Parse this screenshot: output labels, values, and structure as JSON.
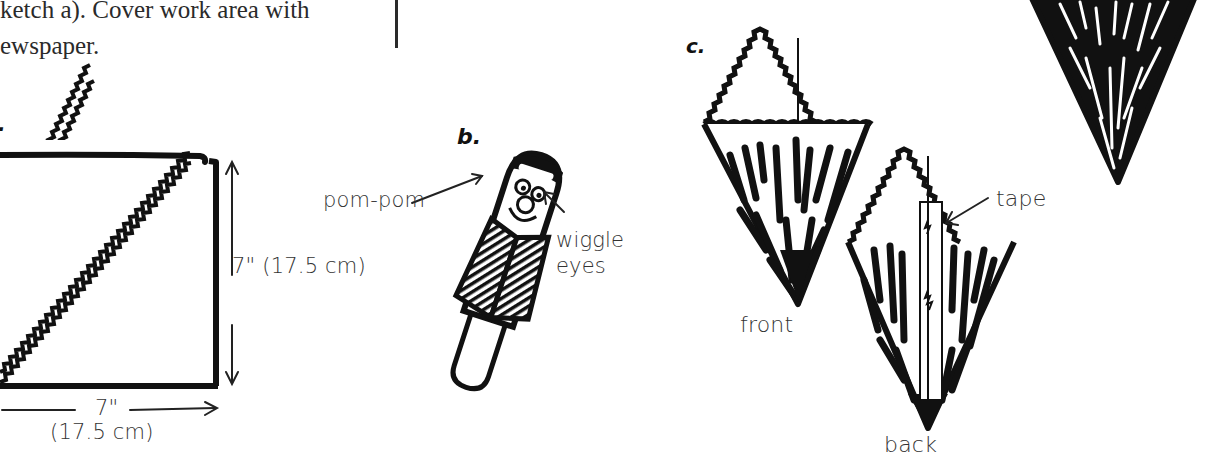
{
  "page": {
    "type": "craft-instructions-scan",
    "background": "#ffffff",
    "ink": "#111111"
  },
  "text_column": {
    "lines": [
      "ketch a). Cover work area with",
      "ewspaper."
    ]
  },
  "sketch_a": {
    "label": ".",
    "shape": "square folded into triangle with zigzag diagonal",
    "height_label": "7\" (17.5 cm)",
    "width_label_line1": "7\"",
    "width_label_line2": "(17.5 cm)"
  },
  "sketch_b": {
    "label": "b.",
    "callouts": {
      "pom_pom": "pom-pom",
      "wiggle_eyes_line1": "wiggle",
      "wiggle_eyes_line2": "eyes"
    }
  },
  "sketch_c": {
    "label": "c.",
    "front_label": "front",
    "back_label": "back",
    "tape_label": "tape"
  }
}
